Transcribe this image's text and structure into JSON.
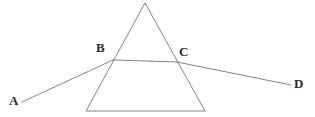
{
  "figure": {
    "width": 315,
    "height": 117,
    "background_color": "#ffffff",
    "line_color": "#767676",
    "label_color": "#2b2b2b",
    "line_width": 0.9
  },
  "prism": {
    "name": "triangular-prism",
    "shape": "triangle",
    "apex": {
      "x": 145,
      "y": 3
    },
    "bottom_left": {
      "x": 86,
      "y": 111
    },
    "bottom_right": {
      "x": 205,
      "y": 111
    }
  },
  "points": {
    "A": {
      "label": "A",
      "x": 22,
      "y": 102,
      "label_x": 9,
      "label_y": 94
    },
    "B": {
      "label": "B",
      "x": 113,
      "y": 60,
      "label_x": 96,
      "label_y": 41
    },
    "C": {
      "label": "C",
      "x": 177,
      "y": 62,
      "label_x": 179,
      "label_y": 45
    },
    "D": {
      "label": "D",
      "x": 291,
      "y": 85,
      "label_x": 294,
      "label_y": 77
    }
  },
  "rays": [
    {
      "name": "incident-ray-ab",
      "from": "A",
      "to": "B",
      "x1": 22,
      "y1": 102,
      "x2": 113,
      "y2": 60
    },
    {
      "name": "refracted-ray-bc",
      "from": "B",
      "to": "C",
      "x1": 113,
      "y1": 60,
      "x2": 177,
      "y2": 62
    },
    {
      "name": "emergent-ray-cd",
      "from": "C",
      "to": "D",
      "x1": 177,
      "y1": 62,
      "x2": 291,
      "y2": 85
    }
  ]
}
